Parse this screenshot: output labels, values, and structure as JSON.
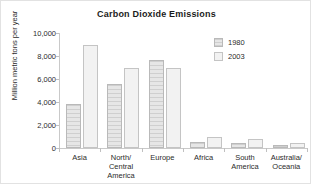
{
  "chart_data": {
    "type": "bar",
    "title": "Carbon Dioxide Emissions",
    "xlabel": "",
    "ylabel": "Million metric tons per year",
    "ylim": [
      0,
      10000
    ],
    "yticks": [
      "0",
      "2,000",
      "4,000",
      "6,000",
      "8,000",
      "10,000"
    ],
    "ytick_values": [
      0,
      2000,
      4000,
      6000,
      8000,
      10000
    ],
    "grid": false,
    "legend_position": "upper right",
    "categories": [
      "Asia",
      "North/\nCentral\nAmerica",
      "Europe",
      "Africa",
      "South\nAmerica",
      "Australia/\nOceania"
    ],
    "series": [
      {
        "name": "1980",
        "values": [
          3800,
          5550,
          7650,
          550,
          450,
          250
        ],
        "color": "#d6d6d6"
      },
      {
        "name": "2003",
        "values": [
          9000,
          7000,
          6950,
          950,
          800,
          400
        ],
        "color": "#f2f2f2"
      }
    ]
  }
}
